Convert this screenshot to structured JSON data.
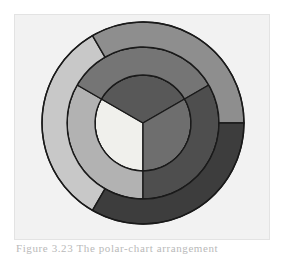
{
  "figure": {
    "panel_background": "#f2f2f2",
    "panel_border": "#e3e3e3",
    "page_background": "#ffffff",
    "caption": "Figure 3.23  The polar-chart arrangement",
    "caption_color": "#b9b9b9",
    "stroke_color": "#1a1a1a"
  },
  "chart_data": {
    "type": "pie",
    "title": "",
    "subtitle": "",
    "xlabel": "",
    "ylabel": "",
    "legend_position": "none",
    "grid": false,
    "center": {
      "x": 142,
      "y": 122
    },
    "radii": {
      "inner_disc": 48,
      "middle_ring_outer": 76,
      "outer_ring_outer": 101
    },
    "rings": [
      {
        "name": "inner-disc",
        "level": 1,
        "inner_radius": 0,
        "outer_radius": 48,
        "start_angle": 0,
        "slices": [
          {
            "label": "Inner A",
            "value": 33.3,
            "start_angle": 180,
            "end_angle": 300,
            "color": "#f0f0ec"
          },
          {
            "label": "Inner B",
            "value": 33.3,
            "start_angle": 300,
            "end_angle": 60,
            "color": "#585858"
          },
          {
            "label": "Inner C",
            "value": 33.3,
            "start_angle": 60,
            "end_angle": 180,
            "color": "#6e6e6e"
          }
        ]
      },
      {
        "name": "middle-ring",
        "level": 2,
        "inner_radius": 48,
        "outer_radius": 76,
        "start_angle": 0,
        "slices": [
          {
            "label": "Middle A",
            "value": 33.3,
            "start_angle": 180,
            "end_angle": 300,
            "color": "#b2b2b2"
          },
          {
            "label": "Middle B",
            "value": 33.3,
            "start_angle": 300,
            "end_angle": 60,
            "color": "#757575"
          },
          {
            "label": "Middle C",
            "value": 33.3,
            "start_angle": 60,
            "end_angle": 180,
            "color": "#4e4e4e"
          }
        ]
      },
      {
        "name": "outer-ring",
        "level": 3,
        "inner_radius": 76,
        "outer_radius": 101,
        "start_angle": 30,
        "slices": [
          {
            "label": "Outer A",
            "value": 33.3,
            "start_angle": 210,
            "end_angle": 330,
            "color": "#c8c8c8"
          },
          {
            "label": "Outer B",
            "value": 33.3,
            "start_angle": 330,
            "end_angle": 90,
            "color": "#8e8e8e"
          },
          {
            "label": "Outer C",
            "value": 33.3,
            "start_angle": 90,
            "end_angle": 210,
            "color": "#3d3d3d"
          }
        ]
      }
    ],
    "values": [
      33.3,
      33.3,
      33.3
    ],
    "categories": [
      "A",
      "B",
      "C"
    ]
  }
}
